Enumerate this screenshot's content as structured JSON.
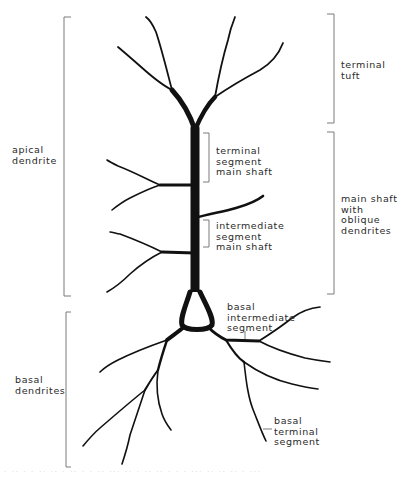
{
  "figure": {
    "ink_color": "#111111",
    "bracket_color": "#7a7a7a",
    "label_color": "#2a2a2a"
  },
  "labels": {
    "apical_dendrite": "apical\ndendrite",
    "basal_dendrites": "basal\ndendrites",
    "terminal_tuft": "terminal\ntuft",
    "terminal_segment_main_shaft": "terminal\nsegment\nmain shaft",
    "intermediate_segment_main_shaft": "intermediate\nsegment\nmain shaft",
    "main_shaft_with_oblique_dendrites": "main shaft\nwith\noblique\ndendrites",
    "basal_intermediate_segment": "basal\nintermediate\nsegment",
    "basal_terminal_segment": "basal\nterminal\nsegment"
  },
  "caption": {
    "text": ". .. . . .. .. . .. . . .. ... .. . .. .. . . . ... .. .. .. . ..."
  }
}
